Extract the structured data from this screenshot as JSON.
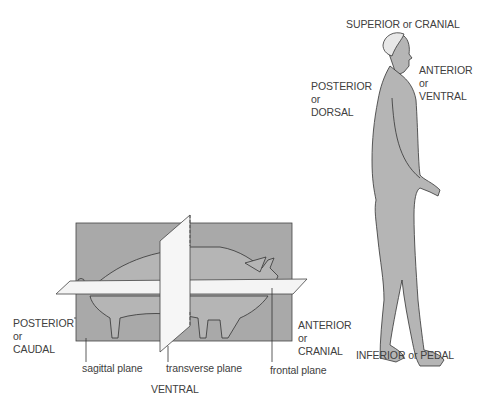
{
  "diagram": {
    "colors": {
      "plane_fill": "#a9a9a9",
      "body_fill": "#b5b5b5",
      "outline": "#333333",
      "background": "#ffffff",
      "text": "#404040"
    },
    "human": {
      "superior": "SUPERIOR or CRANIAL",
      "anterior": [
        "ANTERIOR",
        "or",
        "VENTRAL"
      ],
      "posterior": [
        "POSTERIOR",
        "or",
        "DORSAL"
      ],
      "inferior": "INFERIOR or PEDAL"
    },
    "pig": {
      "posterior": [
        "POSTERIOR",
        "or",
        "CAUDAL"
      ],
      "anterior": [
        "ANTERIOR",
        "or",
        "CRANIAL"
      ],
      "ventral": "VENTRAL",
      "planes": {
        "sagittal": "sagittal plane",
        "transverse": "transverse plane",
        "frontal": "frontal plane"
      }
    }
  }
}
